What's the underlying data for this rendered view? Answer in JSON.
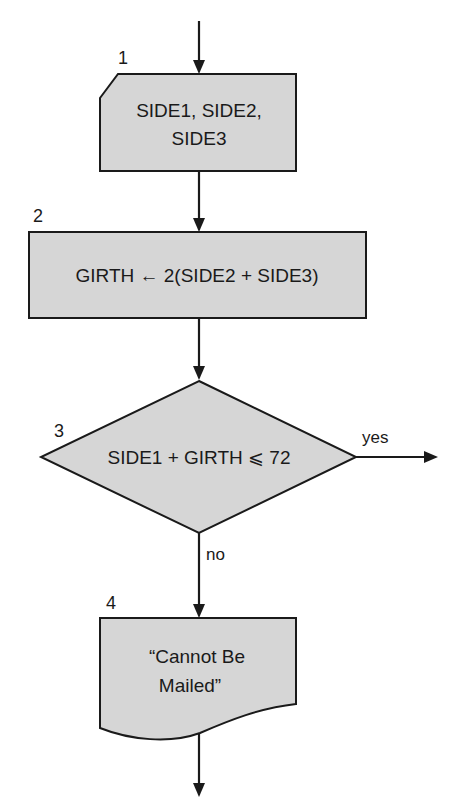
{
  "flowchart": {
    "colors": {
      "shape_fill": "#d6d6d6",
      "stroke": "#1a1a1a",
      "background": "#ffffff"
    },
    "steps": [
      {
        "number": "1",
        "type": "input",
        "lines": [
          "SIDE1, SIDE2,",
          "SIDE3"
        ]
      },
      {
        "number": "2",
        "type": "process",
        "lines": [
          "GIRTH ← 2(SIDE2 + SIDE3)"
        ]
      },
      {
        "number": "3",
        "type": "decision",
        "lines": [
          "SIDE1 + GIRTH ⩽ 72"
        ],
        "branches": {
          "yes": "yes",
          "no": "no"
        }
      },
      {
        "number": "4",
        "type": "output-document",
        "lines": [
          "“Cannot Be",
          "Mailed”"
        ]
      }
    ]
  }
}
